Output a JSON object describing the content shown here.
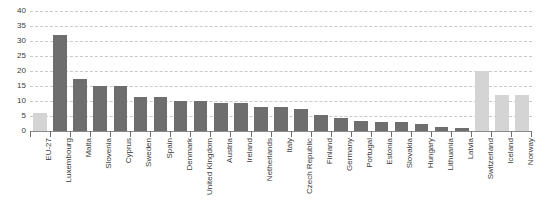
{
  "chart_data": {
    "type": "bar",
    "title": "",
    "xlabel": "",
    "ylabel": "",
    "ylim": [
      0,
      40
    ],
    "yticks": [
      0,
      5,
      10,
      15,
      20,
      25,
      30,
      35,
      40
    ],
    "grid": true,
    "legend": "none",
    "colors": {
      "member_bar": "#6e6e6e",
      "aggregate_bar": "#d4d4d4",
      "gridline": "#c9c9c9",
      "axis": "#6f6f6f",
      "text": "#3b3b3b"
    },
    "categories": [
      "EU-27",
      "Luxembourg",
      "Malta",
      "Slovenia",
      "Cyprus",
      "Sweden",
      "Spain",
      "Denmark",
      "United Kingdom",
      "Austria",
      "Ireland",
      "Netherlands",
      "Italy",
      "Czech Republic",
      "Finland",
      "Germany",
      "Portugal",
      "Estonia",
      "Slovakia",
      "Hungary",
      "Lithuania",
      "Latvia",
      "Switzerland",
      "Iceland",
      "Norway"
    ],
    "values": [
      6,
      32,
      17.5,
      15,
      15,
      11.5,
      11.5,
      10,
      10,
      9.5,
      9.5,
      8,
      8,
      7.5,
      5.5,
      4.5,
      3.5,
      3,
      3,
      2.5,
      1.5,
      1,
      20,
      12,
      12
    ],
    "series_styles": [
      "light",
      "dark",
      "dark",
      "dark",
      "dark",
      "dark",
      "dark",
      "dark",
      "dark",
      "dark",
      "dark",
      "dark",
      "dark",
      "dark",
      "dark",
      "dark",
      "dark",
      "dark",
      "dark",
      "dark",
      "dark",
      "dark",
      "light",
      "light",
      "light"
    ]
  }
}
